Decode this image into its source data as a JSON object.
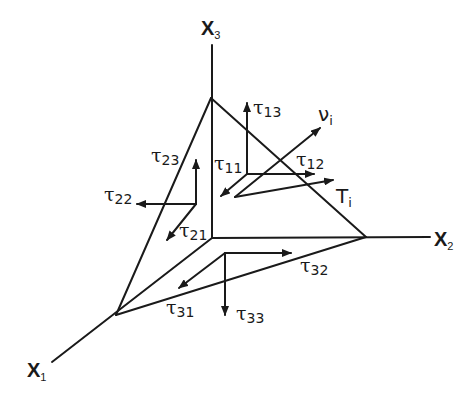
{
  "diagram": {
    "colors": {
      "stroke": "#1a1a1a",
      "background": "#ffffff"
    },
    "axes": [
      {
        "id": "x1",
        "base": "X",
        "sub": "1"
      },
      {
        "id": "x2",
        "base": "X",
        "sub": "2"
      },
      {
        "id": "x3",
        "base": "X",
        "sub": "3"
      }
    ],
    "vectors": {
      "normal": {
        "base": "ν",
        "sub": "i"
      },
      "traction": {
        "base": "T",
        "sub": "i"
      }
    },
    "stress_labels": {
      "t11": {
        "base": "τ",
        "sub": "11"
      },
      "t12": {
        "base": "τ",
        "sub": "12"
      },
      "t13": {
        "base": "τ",
        "sub": "13"
      },
      "t21": {
        "base": "τ",
        "sub": "21"
      },
      "t22": {
        "base": "τ",
        "sub": "22"
      },
      "t23": {
        "base": "τ",
        "sub": "23"
      },
      "t31": {
        "base": "τ",
        "sub": "31"
      },
      "t32": {
        "base": "τ",
        "sub": "32"
      },
      "t33": {
        "base": "τ",
        "sub": "33"
      }
    }
  }
}
